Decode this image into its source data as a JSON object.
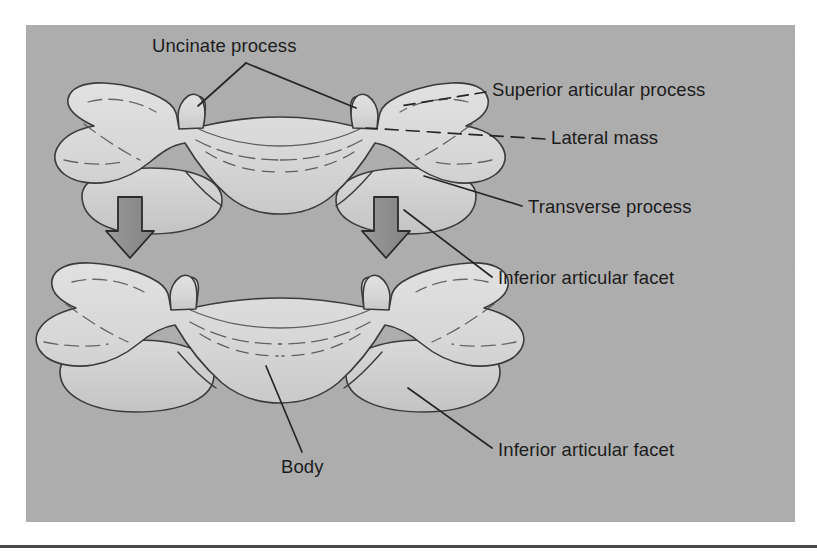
{
  "figure": {
    "panel": {
      "background_color": "#adadad",
      "x": 26,
      "y": 25,
      "width": 769,
      "height": 497
    },
    "page_background_color": "#ffffff",
    "bone_fill_color": "#d7d7d7",
    "bone_fill_shadow_color": "#c6c6c6",
    "bone_outline_color": "#3b3b3b",
    "arrow_fill_color": "#8e8e8e",
    "arrow_outline_color": "#2b2b2b",
    "leader_line_color": "#262626",
    "label_text_color": "#1c1c1c",
    "rule": {
      "color": "#4a4a4a",
      "y": 545,
      "x": 0,
      "width": 817,
      "thickness": 3
    }
  },
  "labels": [
    {
      "id": "uncinate-process",
      "text": "Uncinate process",
      "text_x": 152,
      "text_y": 52,
      "anchor": "start",
      "leader_style": "solid-branched",
      "leader_paths": [
        "M 240 60 L 310 72 L 378 60",
        "M 310 72 L 310 72"
      ],
      "branches": [
        "M 300 62 L 180 100",
        "M 322 62 L 340 100"
      ]
    },
    {
      "id": "superior-articular-process",
      "text": "Superior articular process",
      "text_x": 492,
      "text_y": 96,
      "anchor": "start",
      "leader_style": "dashed",
      "leader_path": "M 486 92 L 400 104"
    },
    {
      "id": "lateral-mass",
      "text": "Lateral mass",
      "text_x": 551,
      "text_y": 143,
      "anchor": "start",
      "leader_style": "dashed",
      "leader_path": "M 545 138 L 368 128"
    },
    {
      "id": "transverse-process",
      "text": "Transverse process",
      "text_x": 528,
      "text_y": 212,
      "anchor": "start",
      "leader_style": "solid",
      "leader_path": "M 522 206 L 428 178"
    },
    {
      "id": "inferior-articular-facet-upper",
      "text": "Inferior articular facet",
      "text_x": 498,
      "text_y": 283,
      "anchor": "start",
      "leader_style": "solid",
      "leader_path": "M 492 277 L 404 212"
    },
    {
      "id": "body",
      "text": "Body",
      "text_x": 281,
      "text_y": 472,
      "anchor": "start",
      "leader_style": "solid",
      "leader_path": "M 300 452 L 266 367"
    },
    {
      "id": "inferior-articular-facet-lower",
      "text": "Inferior articular facet",
      "text_x": 498,
      "text_y": 455,
      "anchor": "start",
      "leader_style": "solid",
      "leader_path": "M 492 448 L 406 388"
    }
  ],
  "arrows": [
    {
      "id": "motion-arrow-left",
      "x": 112,
      "y": 197,
      "width": 36,
      "height": 58,
      "direction": "down"
    },
    {
      "id": "motion-arrow-right",
      "x": 368,
      "y": 197,
      "width": 36,
      "height": 58,
      "direction": "down"
    }
  ],
  "vertebrae": [
    {
      "id": "superior-vertebra",
      "position": "upper",
      "parts": [
        "body",
        "uncinate-process-left",
        "uncinate-process-right",
        "lateral-mass-left",
        "lateral-mass-right",
        "superior-articular-process-left",
        "superior-articular-process-right",
        "transverse-process-left",
        "transverse-process-right",
        "inferior-articular-facet-left",
        "inferior-articular-facet-right"
      ]
    },
    {
      "id": "inferior-vertebra",
      "position": "lower",
      "parts": [
        "body",
        "uncinate-process-left",
        "uncinate-process-right",
        "lateral-mass-left",
        "lateral-mass-right",
        "transverse-process-left",
        "transverse-process-right",
        "inferior-articular-facet-left",
        "inferior-articular-facet-right"
      ]
    }
  ]
}
